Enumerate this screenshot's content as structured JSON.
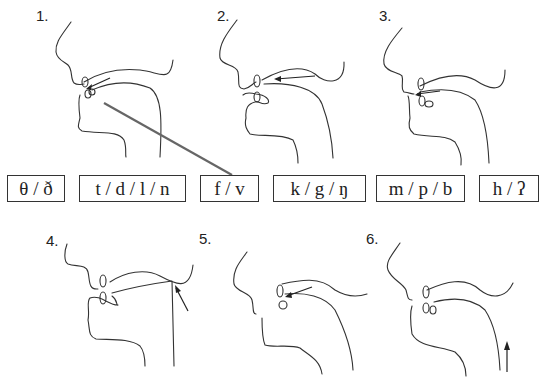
{
  "diagram": {
    "title": "",
    "panels": [
      {
        "number": "1.",
        "place": "dental",
        "arrow": "tongue tip between teeth"
      },
      {
        "number": "2.",
        "place": "labiodental",
        "arrow": "pointing to lower lip / upper teeth"
      },
      {
        "number": "3.",
        "place": "bilabial",
        "arrow": "pointing to lips"
      },
      {
        "number": "4.",
        "place": "velar",
        "arrow": "pointing to soft palate"
      },
      {
        "number": "5.",
        "place": "alveolar",
        "arrow": "pointing to alveolar ridge"
      },
      {
        "number": "6.",
        "place": "glottal",
        "arrow": "upward arrow in throat"
      }
    ],
    "labels": [
      {
        "text": "θ / ð"
      },
      {
        "text": "t / d / l / n"
      },
      {
        "text": "f / v"
      },
      {
        "text": "k / g / ŋ"
      },
      {
        "text": "m / p / b"
      },
      {
        "text": "h / ʔ"
      }
    ],
    "colors": {
      "line": "#333333",
      "pointer_line": "#666666",
      "background": "#ffffff"
    }
  }
}
